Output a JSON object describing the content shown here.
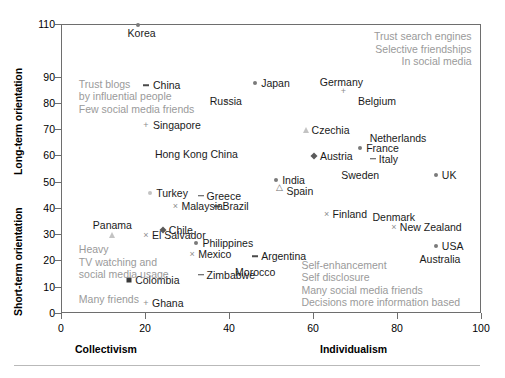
{
  "chart_data": {
    "type": "scatter",
    "title": "",
    "xlabel": "",
    "ylabel": "",
    "xlim": [
      0,
      100
    ],
    "ylim": [
      0,
      110
    ],
    "grid": false,
    "legend": "none",
    "axes": {
      "x_left_label": "Collectivism",
      "x_right_label": "Individualism",
      "y_upper_label": "Long-term orientation",
      "y_lower_label": "Short-term orientation",
      "xticks": [
        0,
        20,
        40,
        60,
        80,
        100
      ],
      "yticks": [
        0,
        10,
        20,
        30,
        40,
        50,
        60,
        70,
        80,
        90,
        110
      ],
      "ytick_labels": [
        "0",
        "10",
        "20",
        "30",
        "40",
        "50",
        "60",
        "70",
        "80",
        "90",
        "110"
      ]
    },
    "points": [
      {
        "label": "Korea",
        "x": 18,
        "y": 110,
        "marker": "circle",
        "label_dx": 4,
        "label_dy": 8,
        "align": "center"
      },
      {
        "label": "China",
        "x": 20,
        "y": 87,
        "marker": "dash",
        "label_dx": 7,
        "label_dy": 0,
        "align": "left"
      },
      {
        "label": "Japan",
        "x": 46,
        "y": 88,
        "marker": "circle",
        "label_dx": 6,
        "label_dy": 0,
        "align": "left"
      },
      {
        "label": "Germany",
        "x": 67,
        "y": 85,
        "marker": "plus",
        "label_dx": -2,
        "label_dy": -9,
        "align": "center"
      },
      {
        "label": "Belgium",
        "x": 75,
        "y": 81,
        "marker": "none",
        "label_dx": 0,
        "label_dy": 0,
        "align": "center"
      },
      {
        "label": "Russia",
        "x": 39,
        "y": 81,
        "marker": "faint",
        "label_dx": 0,
        "label_dy": 0,
        "align": "center"
      },
      {
        "label": "Singapore",
        "x": 20,
        "y": 72,
        "marker": "plus",
        "label_dx": 7,
        "label_dy": 0,
        "align": "left"
      },
      {
        "label": "Czechia",
        "x": 58,
        "y": 70,
        "marker": "triangle",
        "label_dx": 6,
        "label_dy": 0,
        "align": "left"
      },
      {
        "label": "Netherlands",
        "x": 80,
        "y": 67,
        "marker": "none",
        "label_dx": 0,
        "label_dy": 0,
        "align": "center"
      },
      {
        "label": "Hong Kong China",
        "x": 32,
        "y": 61,
        "marker": "none",
        "label_dx": 0,
        "label_dy": 0,
        "align": "center"
      },
      {
        "label": "France",
        "x": 71,
        "y": 63,
        "marker": "circle",
        "label_dx": 6,
        "label_dy": 0,
        "align": "left"
      },
      {
        "label": "Austria",
        "x": 60,
        "y": 60,
        "marker": "diamond",
        "label_dx": 6,
        "label_dy": 0,
        "align": "left"
      },
      {
        "label": "Italy",
        "x": 74,
        "y": 59,
        "marker": "dash",
        "label_dx": 6,
        "label_dy": 0,
        "align": "left"
      },
      {
        "label": "Sweden",
        "x": 71,
        "y": 53,
        "marker": "none",
        "label_dx": 0,
        "label_dy": 0,
        "align": "center"
      },
      {
        "label": "UK",
        "x": 89,
        "y": 53,
        "marker": "circle",
        "label_dx": 6,
        "label_dy": 0,
        "align": "left"
      },
      {
        "label": "India",
        "x": 51,
        "y": 51,
        "marker": "circle",
        "label_dx": 6,
        "label_dy": 0,
        "align": "left"
      },
      {
        "label": "Spain",
        "x": 52,
        "y": 47,
        "marker": "triangle-open",
        "label_dx": 6,
        "label_dy": 0,
        "align": "left"
      },
      {
        "label": "Turkey",
        "x": 21,
        "y": 46,
        "marker": "faint",
        "label_dx": 6,
        "label_dy": 0,
        "align": "left"
      },
      {
        "label": "Greece",
        "x": 33,
        "y": 45,
        "marker": "dash",
        "label_dx": 6,
        "label_dy": 0,
        "align": "left"
      },
      {
        "label": "Malaysia",
        "x": 27,
        "y": 41,
        "marker": "cross",
        "label_dx": 6,
        "label_dy": 0,
        "align": "left"
      },
      {
        "label": "Brazil",
        "x": 37,
        "y": 41,
        "marker": "dash",
        "label_dx": 5,
        "label_dy": 0,
        "align": "left"
      },
      {
        "label": "Finland",
        "x": 63,
        "y": 38,
        "marker": "cross",
        "label_dx": 6,
        "label_dy": 0,
        "align": "left"
      },
      {
        "label": "Denmark",
        "x": 79,
        "y": 37,
        "marker": "none",
        "label_dx": 0,
        "label_dy": 0,
        "align": "center"
      },
      {
        "label": "New Zealand",
        "x": 79,
        "y": 33,
        "marker": "cross",
        "label_dx": 6,
        "label_dy": 0,
        "align": "left"
      },
      {
        "label": "Chile",
        "x": 24,
        "y": 32,
        "marker": "diamond",
        "label_dx": 6,
        "label_dy": 0,
        "align": "left"
      },
      {
        "label": "Panama",
        "x": 12,
        "y": 30,
        "marker": "triangle",
        "label_dx": 0,
        "label_dy": -10,
        "align": "center"
      },
      {
        "label": "El Salvador",
        "x": 20,
        "y": 30,
        "marker": "cross",
        "label_dx": 6,
        "label_dy": 0,
        "align": "left"
      },
      {
        "label": "Philippines",
        "x": 32,
        "y": 27,
        "marker": "circle",
        "label_dx": 6,
        "label_dy": 0,
        "align": "left"
      },
      {
        "label": "USA",
        "x": 89,
        "y": 26,
        "marker": "circle",
        "label_dx": 6,
        "label_dy": 0,
        "align": "left"
      },
      {
        "label": "Mexico",
        "x": 31,
        "y": 23,
        "marker": "cross",
        "label_dx": 6,
        "label_dy": 0,
        "align": "left"
      },
      {
        "label": "Argentina",
        "x": 46,
        "y": 22,
        "marker": "dash",
        "label_dx": 6,
        "label_dy": 0,
        "align": "left"
      },
      {
        "label": "Australia",
        "x": 90,
        "y": 21,
        "marker": "none",
        "label_dx": 0,
        "label_dy": 0,
        "align": "center"
      },
      {
        "label": "Zimbabwe",
        "x": 33,
        "y": 15,
        "marker": "dash",
        "label_dx": 6,
        "label_dy": 0,
        "align": "left"
      },
      {
        "label": "Morocco",
        "x": 46,
        "y": 16,
        "marker": "none",
        "label_dx": 0,
        "label_dy": 0,
        "align": "center"
      },
      {
        "label": "Colombia",
        "x": 16,
        "y": 13,
        "marker": "square",
        "label_dx": 6,
        "label_dy": 0,
        "align": "left"
      },
      {
        "label": "Ghana",
        "x": 20,
        "y": 4,
        "marker": "plus",
        "label_dx": 6,
        "label_dy": 0,
        "align": "left"
      }
    ],
    "annotations": [
      {
        "id": "top-left",
        "lines": [
          "Trust blogs",
          "by influential people",
          "Few social media friends"
        ],
        "x": 4,
        "y": 90,
        "align": "left"
      },
      {
        "id": "top-right",
        "lines": [
          "Trust search engines",
          "Selective friendships",
          "In social media"
        ],
        "x": 98,
        "y": 108,
        "align": "right"
      },
      {
        "id": "bottom-left",
        "lines": [
          "Heavy",
          "TV watching and",
          "social media usage",
          "",
          "Many friends"
        ],
        "x": 4,
        "y": 27,
        "align": "left"
      },
      {
        "id": "bottom-right",
        "lines": [
          "Self-enhancement",
          "Self disclosure",
          "Many social media friends",
          "Decisions more information based"
        ],
        "x": 57,
        "y": 21,
        "align": "left"
      }
    ]
  }
}
